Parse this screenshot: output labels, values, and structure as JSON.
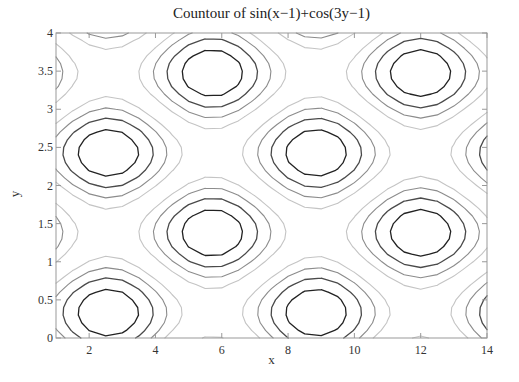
{
  "chart_data": {
    "type": "contour",
    "title": "Countour of sin(x−1)+cos(3y−1)",
    "function": "sin(x-1)+cos(3y-1)",
    "xlabel": "x",
    "ylabel": "y",
    "xlim": [
      1,
      14
    ],
    "ylim": [
      0,
      4
    ],
    "xticks": [
      2,
      4,
      6,
      8,
      10,
      12,
      14
    ],
    "xtick_labels": [
      "2",
      "4",
      "6",
      "8",
      "10",
      "12",
      "14"
    ],
    "yticks": [
      0,
      0.5,
      1,
      1.5,
      2,
      2.5,
      3,
      3.5,
      4
    ],
    "ytick_labels": [
      "0",
      "0.5",
      "1",
      "1.5",
      "2",
      "2.5",
      "3",
      "3.5",
      "4"
    ],
    "grid_x_step": 0.5,
    "grid_y_step": 0.1,
    "levels": [
      -1.6,
      -1.2,
      -0.8,
      -0.4,
      0.4,
      0.8,
      1.2,
      1.6
    ],
    "level_colors": {
      "1.6": "#222222",
      "1.2": "#4a4a4a",
      "0.8": "#8c8c8c",
      "0.4": "#c4c4c4",
      "-1.6": "#222222",
      "-1.2": "#4a4a4a",
      "-0.8": "#8c8c8c",
      "-0.4": "#c4c4c4"
    },
    "grid": false,
    "legend": "none",
    "colormap": "gray"
  },
  "axes_color": "#999999"
}
